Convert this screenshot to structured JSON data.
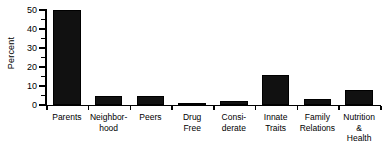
{
  "chart_data": {
    "type": "bar",
    "title": "",
    "xlabel": "",
    "ylabel": "Percent",
    "ylim": [
      0,
      50
    ],
    "grid": false,
    "legend": false,
    "y_major_ticks": [
      0,
      10,
      20,
      30,
      40,
      50
    ],
    "y_minor_ticks": [
      5,
      15,
      25,
      35,
      45
    ],
    "y_tick_labels": [
      "0",
      "10",
      "20",
      "30",
      "40",
      "50"
    ],
    "categories": [
      "Parents",
      "Neighbor-\nhood",
      "Peers",
      "Drug\nFree",
      "Consi-\nderate",
      "Innate\nTraits",
      "Family\nRelations",
      "Nutrition\n& Health"
    ],
    "values": [
      50,
      5,
      5,
      1,
      2,
      16,
      3,
      8
    ],
    "bar_color": "#111111",
    "axis_color": "#000000",
    "background_color": "#ffffff"
  }
}
